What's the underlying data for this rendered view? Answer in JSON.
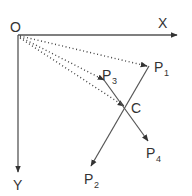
{
  "diagram": {
    "colors": {
      "background": "#ffffff",
      "stroke": "#555555",
      "text": "#333333"
    },
    "origin": {
      "label": "O"
    },
    "axes": {
      "x": {
        "label": "X"
      },
      "y": {
        "label": "Y"
      }
    },
    "points": {
      "p1": {
        "label": "P",
        "subscript": "1"
      },
      "p2": {
        "label": "P",
        "subscript": "2"
      },
      "p3": {
        "label": "P",
        "subscript": "3"
      },
      "p4": {
        "label": "P",
        "subscript": "4"
      },
      "c": {
        "label": "C"
      }
    },
    "edges": [
      {
        "from": "O",
        "to": "P1",
        "style": "dotted"
      },
      {
        "from": "O",
        "to": "P3",
        "style": "dotted"
      },
      {
        "from": "O",
        "to": "C",
        "style": "dotted"
      },
      {
        "from": "P3",
        "to": "P4",
        "style": "solid",
        "through": "C"
      },
      {
        "from": "P1",
        "to": "P2",
        "style": "solid",
        "through": "C"
      }
    ]
  }
}
